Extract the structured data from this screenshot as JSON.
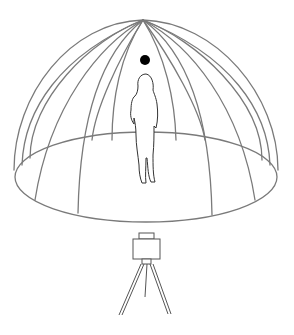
{
  "diagram": {
    "type": "illustration",
    "subject": "light dome capture setup",
    "elements": {
      "dome": {
        "name": "dome",
        "meridians": 12,
        "stroke": "#7a7a7a"
      },
      "floor": {
        "name": "floor-ellipse",
        "stroke": "#7a7a7a"
      },
      "light_source": {
        "name": "point-light",
        "fill": "#000000"
      },
      "subject": {
        "name": "standing-person",
        "stroke": "#333333"
      },
      "camera": {
        "name": "camera-on-tripod",
        "stroke": "#555555"
      }
    },
    "colors": {
      "background": "#ffffff",
      "dome_lines": "#7a7a7a",
      "figure_lines": "#333333",
      "light_dot": "#000000"
    }
  }
}
